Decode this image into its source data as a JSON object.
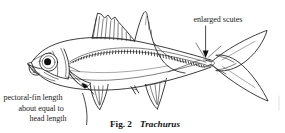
{
  "figure": {
    "domain": "Diagram",
    "background_color": "#ffffff",
    "ink_color": "#1a1a1a",
    "caption": {
      "prefix": "Fig. 2",
      "taxon": "Trachurus",
      "taxon_style": "bold-italic"
    },
    "annotations": [
      {
        "id": "enlarged-scutes",
        "text": "enlarged scutes",
        "position": "top-right",
        "leader": "vertical arrow pointing down to caudal peduncle scutes"
      },
      {
        "id": "pectoral-fin-length",
        "lines": [
          "pectoral-fin length",
          "about equal to",
          "head length"
        ],
        "position": "bottom-left",
        "leader": "arrow pointing up-right to pectoral fin base"
      }
    ],
    "anatomy_labels": [
      "eye",
      "snout",
      "operculum",
      "first dorsal fin",
      "second dorsal fin",
      "pectoral fin",
      "pelvic fin",
      "anal fin",
      "anal spines",
      "lateral line",
      "scutes",
      "caudal peduncle",
      "caudal fin"
    ]
  }
}
